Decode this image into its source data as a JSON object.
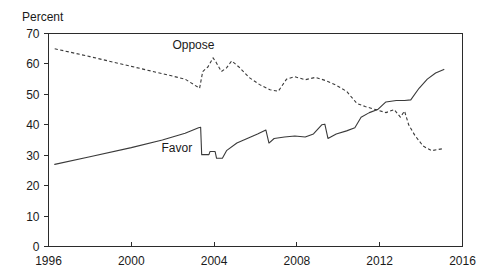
{
  "chart_data": {
    "type": "line",
    "title": "",
    "ylabel": "Percent",
    "xlabel": "",
    "xlim": [
      1996,
      2016
    ],
    "ylim": [
      0,
      70
    ],
    "grid": false,
    "legend_position": "inline-annotations",
    "xticks": [
      1996,
      2000,
      2004,
      2008,
      2012,
      2016
    ],
    "xtick_labels": [
      "1996",
      "2000",
      "2004",
      "2008",
      "2012",
      "2016"
    ],
    "yticks": [
      0,
      10,
      20,
      30,
      40,
      50,
      60,
      70
    ],
    "ytick_labels": [
      "0",
      "10",
      "20",
      "30",
      "40",
      "50",
      "60",
      "70"
    ],
    "annotations": [
      {
        "text": "Oppose",
        "x": 2003.0,
        "y": 65.0
      },
      {
        "text": "Favor",
        "x": 2002.2,
        "y": 31.0
      }
    ],
    "series": [
      {
        "name": "Oppose",
        "style": "dashed",
        "points": [
          [
            1996.3,
            65.0
          ],
          [
            1998.0,
            62.4
          ],
          [
            2000.0,
            59.2
          ],
          [
            2001.5,
            56.8
          ],
          [
            2002.6,
            55.0
          ],
          [
            2003.3,
            52.0
          ],
          [
            2003.45,
            57.5
          ],
          [
            2003.7,
            59.0
          ],
          [
            2003.95,
            62.0
          ],
          [
            2004.1,
            60.5
          ],
          [
            2004.35,
            57.5
          ],
          [
            2004.6,
            58.7
          ],
          [
            2004.85,
            61.0
          ],
          [
            2005.2,
            59.0
          ],
          [
            2005.7,
            55.5
          ],
          [
            2006.2,
            53.2
          ],
          [
            2006.7,
            51.5
          ],
          [
            2007.1,
            51.0
          ],
          [
            2007.5,
            55.0
          ],
          [
            2007.9,
            55.8
          ],
          [
            2008.4,
            54.8
          ],
          [
            2008.9,
            55.6
          ],
          [
            2009.4,
            54.5
          ],
          [
            2009.9,
            53.0
          ],
          [
            2010.4,
            51.0
          ],
          [
            2010.9,
            47.0
          ],
          [
            2011.3,
            46.0
          ],
          [
            2011.8,
            45.0
          ],
          [
            2012.3,
            44.0
          ],
          [
            2012.7,
            45.0
          ],
          [
            2013.0,
            42.5
          ],
          [
            2013.2,
            44.5
          ],
          [
            2013.4,
            40.0
          ],
          [
            2013.7,
            36.5
          ],
          [
            2014.1,
            33.0
          ],
          [
            2014.5,
            31.5
          ],
          [
            2414.8,
            32.0
          ],
          [
            2015.1,
            32.2
          ]
        ]
      },
      {
        "name": "Favor",
        "style": "solid",
        "points": [
          [
            1996.3,
            27.0
          ],
          [
            1998.0,
            29.5
          ],
          [
            2000.0,
            32.5
          ],
          [
            2001.5,
            35.0
          ],
          [
            2002.6,
            37.2
          ],
          [
            2003.25,
            39.0
          ],
          [
            2003.35,
            39.2
          ],
          [
            2003.4,
            30.2
          ],
          [
            2003.75,
            30.2
          ],
          [
            2003.8,
            31.2
          ],
          [
            2004.05,
            31.2
          ],
          [
            2004.12,
            29.0
          ],
          [
            2004.4,
            29.0
          ],
          [
            2004.6,
            31.5
          ],
          [
            2005.1,
            34.0
          ],
          [
            2005.6,
            35.5
          ],
          [
            2006.1,
            37.0
          ],
          [
            2006.5,
            38.3
          ],
          [
            2006.65,
            34.0
          ],
          [
            2006.9,
            35.5
          ],
          [
            2007.4,
            36.0
          ],
          [
            2007.9,
            36.3
          ],
          [
            2008.4,
            36.0
          ],
          [
            2008.8,
            37.0
          ],
          [
            2009.2,
            40.0
          ],
          [
            2009.35,
            40.2
          ],
          [
            2009.5,
            35.5
          ],
          [
            2009.9,
            37.0
          ],
          [
            2010.4,
            38.0
          ],
          [
            2010.8,
            39.0
          ],
          [
            2011.1,
            42.5
          ],
          [
            2011.5,
            44.0
          ],
          [
            2011.9,
            45.0
          ],
          [
            2012.3,
            47.5
          ],
          [
            2012.8,
            48.0
          ],
          [
            2013.2,
            48.0
          ],
          [
            2013.5,
            48.2
          ],
          [
            2013.9,
            52.0
          ],
          [
            2014.3,
            55.0
          ],
          [
            2014.7,
            57.0
          ],
          [
            2015.1,
            58.2
          ]
        ]
      }
    ]
  },
  "axis": {
    "y_axis_title": "Percent"
  }
}
